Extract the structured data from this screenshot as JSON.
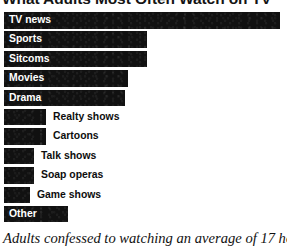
{
  "chart_data": {
    "type": "bar",
    "orientation": "horizontal",
    "title": "What Adults Most Often Watch on TV",
    "caption": "Adults confessed to watching an average of 17 hours",
    "xlabel": "",
    "ylabel": "",
    "grid": false,
    "legend": "none",
    "xlim": [
      0,
      100
    ],
    "categories": [
      "TV news",
      "Sports",
      "Sitcoms",
      "Movies",
      "Drama",
      "Realty shows",
      "Cartoons",
      "Talk shows",
      "Soap operas",
      "Game shows",
      "Other"
    ],
    "values": [
      100,
      52,
      52,
      45,
      44,
      15,
      15,
      11,
      11,
      9,
      23
    ],
    "bars": [
      {
        "label": "TV news",
        "value": 100,
        "bar_px": 276,
        "label_position": "inside"
      },
      {
        "label": "Sports",
        "value": 52,
        "bar_px": 143,
        "label_position": "inside"
      },
      {
        "label": "Sitcoms",
        "value": 52,
        "bar_px": 143,
        "label_position": "inside"
      },
      {
        "label": "Movies",
        "value": 45,
        "bar_px": 124,
        "label_position": "inside"
      },
      {
        "label": "Drama",
        "value": 44,
        "bar_px": 121,
        "label_position": "inside"
      },
      {
        "label": "Realty shows",
        "value": 15,
        "bar_px": 42,
        "label_position": "outside",
        "label_left_px": 53
      },
      {
        "label": "Cartoons",
        "value": 15,
        "bar_px": 42,
        "label_position": "outside",
        "label_left_px": 53
      },
      {
        "label": "Talk shows",
        "value": 11,
        "bar_px": 30,
        "label_position": "outside",
        "label_left_px": 41
      },
      {
        "label": "Soap operas",
        "value": 11,
        "bar_px": 30,
        "label_position": "outside",
        "label_left_px": 41
      },
      {
        "label": "Game shows",
        "value": 9,
        "bar_px": 26,
        "label_position": "outside",
        "label_left_px": 37
      },
      {
        "label": "Other",
        "value": 23,
        "bar_px": 64,
        "label_position": "inside"
      }
    ],
    "colors": {
      "bar": "#111111",
      "background": "#ffffff",
      "label_inside": "#ffffff",
      "label_outside": "#0d0d0d",
      "title": "#141414",
      "caption": "#111111"
    }
  }
}
